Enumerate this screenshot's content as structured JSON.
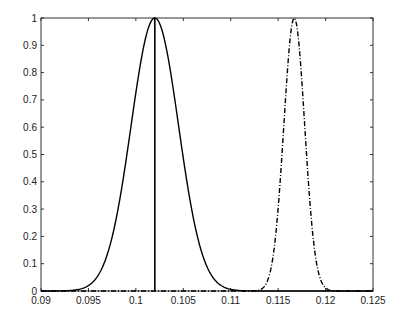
{
  "chart_data": {
    "type": "line",
    "title": "",
    "xlabel": "",
    "ylabel": "",
    "xlim": [
      0.09,
      0.125
    ],
    "ylim": [
      0,
      1
    ],
    "grid": false,
    "legend": null,
    "x_ticks": [
      "0.09",
      "0.095",
      "0.1",
      "0.105",
      "0.11",
      "0.115",
      "0.12",
      "0.125"
    ],
    "y_ticks": [
      "0",
      "0.1",
      "0.2",
      "0.3",
      "0.4",
      "0.5",
      "0.6",
      "0.7",
      "0.8",
      "0.9",
      "1"
    ],
    "series": [
      {
        "name": "solid-gaussian",
        "style": "solid",
        "color": "#000000",
        "shape": "gaussian",
        "peak_x": 0.102,
        "peak_y": 1.0,
        "sigma": 0.0025,
        "x": [
          0.092,
          0.094,
          0.096,
          0.098,
          0.1,
          0.101,
          0.102,
          0.103,
          0.104,
          0.106,
          0.108,
          0.11,
          0.112
        ],
        "values": [
          0.0003,
          0.006,
          0.056,
          0.278,
          0.726,
          0.923,
          1.0,
          0.923,
          0.726,
          0.278,
          0.056,
          0.006,
          0.0003
        ]
      },
      {
        "name": "dashdot-gaussian",
        "style": "dash-dot",
        "color": "#000000",
        "shape": "gaussian",
        "peak_x": 0.1167,
        "peak_y": 1.0,
        "sigma": 0.0011,
        "x": [
          0.112,
          0.113,
          0.114,
          0.115,
          0.116,
          0.1167,
          0.1175,
          0.118,
          0.119,
          0.12,
          0.121
        ],
        "values": [
          0.0001,
          0.004,
          0.049,
          0.303,
          0.817,
          1.0,
          0.768,
          0.497,
          0.112,
          0.011,
          0.0005
        ]
      }
    ],
    "annotations": [
      {
        "type": "vertical-line",
        "x": 0.102,
        "y_from": 0,
        "y_to": 1,
        "style": "solid",
        "color": "#000000"
      }
    ]
  }
}
